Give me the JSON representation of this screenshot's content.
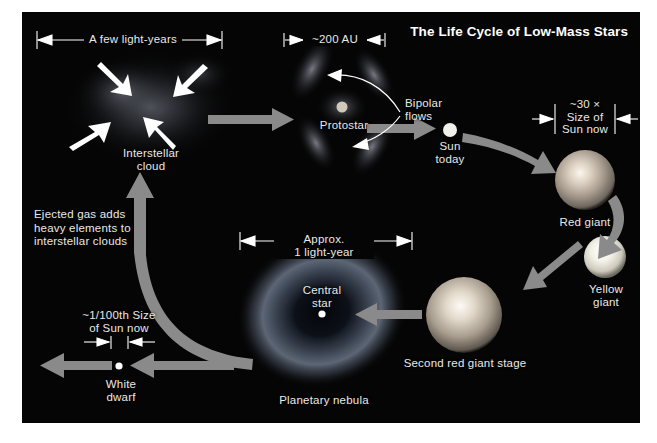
{
  "figure": {
    "title": "The Life Cycle of Low-Mass Stars",
    "background_color": "#050505",
    "page_color": "#ffffff",
    "arrow_color": "#8a8a8a",
    "label_color": "#e9e9e9"
  },
  "stages": {
    "interstellar_cloud": {
      "label": "Interstellar\ncloud",
      "dimension": "A few light-years"
    },
    "protostar": {
      "label": "Protostar",
      "dimension": "~200 AU",
      "flows_label": "Bipolar\nflows"
    },
    "sun_today": {
      "label": "Sun\ntoday"
    },
    "red_giant": {
      "label": "Red giant",
      "dimension": "~30 ×\nSize of\nSun now"
    },
    "yellow_giant": {
      "label": "Yellow\ngiant"
    },
    "second_red_giant": {
      "label": "Second red giant stage"
    },
    "planetary_nebula": {
      "label": "Planetary nebula",
      "central_star_label": "Central\nstar",
      "dimension": "Approx.\n1 light-year"
    },
    "white_dwarf": {
      "label": "White\ndwarf",
      "dimension": "~1/100th Size\nof Sun now"
    },
    "ejected_gas": {
      "note": "Ejected gas adds\nheavy elements to\ninterstellar clouds"
    }
  }
}
